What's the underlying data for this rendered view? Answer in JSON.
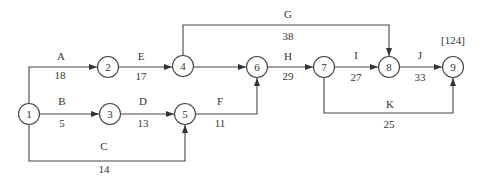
{
  "diagram": {
    "type": "activity-on-arrow network",
    "total_duration_label": "[124]",
    "nodes": [
      {
        "id": "1",
        "label": "1",
        "x": 29,
        "y": 114
      },
      {
        "id": "2",
        "label": "2",
        "x": 108,
        "y": 67
      },
      {
        "id": "3",
        "label": "3",
        "x": 110,
        "y": 114
      },
      {
        "id": "4",
        "label": "4",
        "x": 183,
        "y": 66
      },
      {
        "id": "5",
        "label": "5",
        "x": 185,
        "y": 114
      },
      {
        "id": "6",
        "label": "6",
        "x": 257,
        "y": 67
      },
      {
        "id": "7",
        "label": "7",
        "x": 324,
        "y": 67
      },
      {
        "id": "8",
        "label": "8",
        "x": 389,
        "y": 67
      },
      {
        "id": "9",
        "label": "9",
        "x": 453,
        "y": 67
      }
    ],
    "activities": [
      {
        "name": "A",
        "duration": "18",
        "from": "1",
        "to": "2"
      },
      {
        "name": "B",
        "duration": "5",
        "from": "1",
        "to": "3"
      },
      {
        "name": "C",
        "duration": "14",
        "from": "1",
        "to": "5"
      },
      {
        "name": "D",
        "duration": "13",
        "from": "3",
        "to": "5"
      },
      {
        "name": "E",
        "duration": "17",
        "from": "2",
        "to": "4"
      },
      {
        "name": "F",
        "duration": "11",
        "from": "5",
        "to": "6"
      },
      {
        "name": "G",
        "duration": "38",
        "from": "4",
        "to": "8"
      },
      {
        "name": "H",
        "duration": "29",
        "from": "6",
        "to": "7"
      },
      {
        "name": "I",
        "duration": "27",
        "from": "7",
        "to": "8"
      },
      {
        "name": "J",
        "duration": "33",
        "from": "8",
        "to": "9"
      },
      {
        "name": "K",
        "duration": "25",
        "from": "7",
        "to": "9"
      }
    ]
  }
}
